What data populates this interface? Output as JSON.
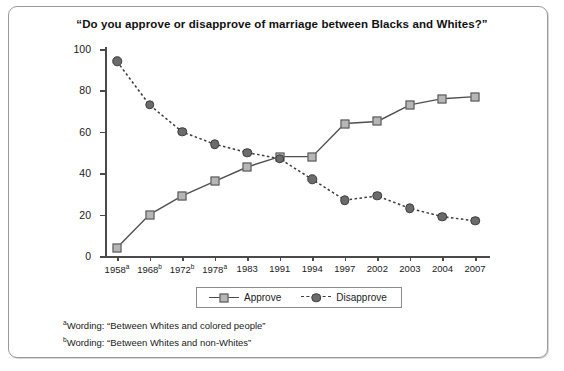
{
  "chart_data": {
    "type": "line",
    "title": "“Do you approve or disapprove of marriage between Blacks and Whites?”",
    "xlabel": "",
    "ylabel": "",
    "ylim": [
      0,
      100
    ],
    "yticks": [
      0,
      20,
      40,
      60,
      80,
      100
    ],
    "grid": false,
    "legend_position": "bottom",
    "categories": [
      "1958",
      "1968",
      "1972",
      "1978",
      "1983",
      "1991",
      "1994",
      "1997",
      "2002",
      "2003",
      "2004",
      "2007"
    ],
    "category_labels": [
      "1958a",
      "1968b",
      "1972b",
      "1978a",
      "1983",
      "1991",
      "1994",
      "1997",
      "2002",
      "2003",
      "2004",
      "2007"
    ],
    "category_footnotes": [
      "a",
      "b",
      "b",
      "a",
      "",
      "",
      "",
      "",
      "",
      "",
      "",
      ""
    ],
    "series": [
      {
        "name": "Approve",
        "marker": "square",
        "line": "solid",
        "color": "#4f4f4f",
        "marker_fill": "#b6b6b6",
        "values": [
          4,
          20,
          29,
          36,
          43,
          48,
          48,
          64,
          65,
          73,
          76,
          77
        ]
      },
      {
        "name": "Disapprove",
        "marker": "circle",
        "line": "dashed",
        "color": "#3c3c3c",
        "marker_fill": "#6b6b6b",
        "values": [
          94,
          73,
          60,
          54,
          50,
          47,
          37,
          27,
          29,
          23,
          19,
          17
        ]
      }
    ]
  },
  "legend": {
    "items": [
      {
        "label": "Approve"
      },
      {
        "label": "Disapprove"
      }
    ]
  },
  "footnotes": [
    {
      "marker": "a",
      "text": "Wording: “Between Whites and colored people”"
    },
    {
      "marker": "b",
      "text": "Wording: “Between Whites and non-Whites”"
    }
  ]
}
